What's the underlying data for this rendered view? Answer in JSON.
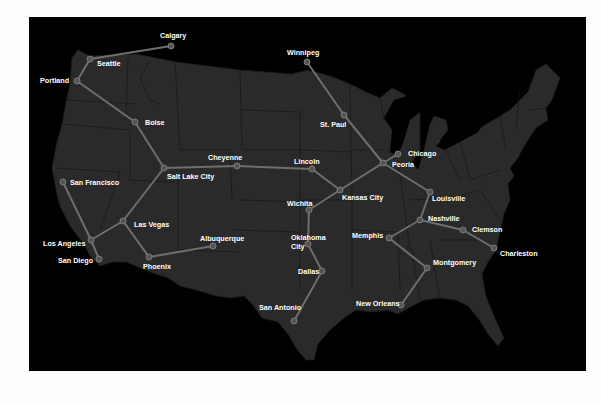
{
  "map": {
    "title": "US rail network",
    "colors": {
      "page_background": "#fdfdfd",
      "ocean": "#000000",
      "land": "#2a2a2a",
      "edge": "#6e6e6e",
      "node": "#555555",
      "label": "#ffffff"
    },
    "nodes": [
      {
        "id": "calgary",
        "label": "Calgary",
        "x": 171,
        "y": 46,
        "lx": 160,
        "ly": 38
      },
      {
        "id": "seattle",
        "label": "Seattle",
        "x": 90,
        "y": 59,
        "lx": 97,
        "ly": 66
      },
      {
        "id": "portland",
        "label": "Portland",
        "x": 77,
        "y": 81,
        "lx": 40,
        "ly": 83
      },
      {
        "id": "boise",
        "label": "Boise",
        "x": 135,
        "y": 122,
        "lx": 145,
        "ly": 125
      },
      {
        "id": "salt-lake-city",
        "label": "Salt Lake City",
        "x": 164,
        "y": 168,
        "lx": 167,
        "ly": 179
      },
      {
        "id": "cheyenne",
        "label": "Cheyenne",
        "x": 237,
        "y": 166,
        "lx": 208,
        "ly": 160
      },
      {
        "id": "lincoln",
        "label": "Lincoln",
        "x": 312,
        "y": 169,
        "lx": 294,
        "ly": 164
      },
      {
        "id": "san-francisco",
        "label": "San Francisco",
        "x": 63,
        "y": 182,
        "lx": 70,
        "ly": 185
      },
      {
        "id": "las-vegas",
        "label": "Las Vegas",
        "x": 123,
        "y": 221,
        "lx": 134,
        "ly": 227
      },
      {
        "id": "los-angeles",
        "label": "Los Angeles",
        "x": 91,
        "y": 240,
        "lx": 43,
        "ly": 246
      },
      {
        "id": "san-diego",
        "label": "San Diego",
        "x": 99,
        "y": 259,
        "lx": 58,
        "ly": 263
      },
      {
        "id": "phoenix",
        "label": "Phoenix",
        "x": 149,
        "y": 257,
        "lx": 143,
        "ly": 269
      },
      {
        "id": "albuquerque",
        "label": "Albuquerque",
        "x": 213,
        "y": 246,
        "lx": 200,
        "ly": 241
      },
      {
        "id": "winnipeg",
        "label": "Winnipeg",
        "x": 307,
        "y": 62,
        "lx": 287,
        "ly": 55
      },
      {
        "id": "st-paul",
        "label": "St. Paul",
        "x": 344,
        "y": 115,
        "lx": 320,
        "ly": 127
      },
      {
        "id": "chicago",
        "label": "Chicago",
        "x": 398,
        "y": 154,
        "lx": 408,
        "ly": 156
      },
      {
        "id": "peoria",
        "label": "Peoria",
        "x": 383,
        "y": 163,
        "lx": 392,
        "ly": 167
      },
      {
        "id": "kansas-city",
        "label": "Kansas City",
        "x": 340,
        "y": 190,
        "lx": 342,
        "ly": 200
      },
      {
        "id": "wichita",
        "label": "Wichita",
        "x": 309,
        "y": 210,
        "lx": 287,
        "ly": 206
      },
      {
        "id": "oklahoma-city",
        "label": "Oklahoma City",
        "x": 308,
        "y": 244,
        "lx": 291,
        "ly": 240,
        "label2": "City",
        "ly2": 249
      },
      {
        "id": "dallas",
        "label": "Dallas",
        "x": 322,
        "y": 271,
        "lx": 298,
        "ly": 274
      },
      {
        "id": "san-antonio",
        "label": "San Antonio",
        "x": 294,
        "y": 321,
        "lx": 259,
        "ly": 310
      },
      {
        "id": "louisville",
        "label": "Louisville",
        "x": 430,
        "y": 192,
        "lx": 432,
        "ly": 201
      },
      {
        "id": "nashville",
        "label": "Nashville",
        "x": 420,
        "y": 220,
        "lx": 428,
        "ly": 221
      },
      {
        "id": "clemson",
        "label": "Clemson",
        "x": 463,
        "y": 230,
        "lx": 472,
        "ly": 232
      },
      {
        "id": "charleston",
        "label": "Charleston",
        "x": 494,
        "y": 248,
        "lx": 500,
        "ly": 256
      },
      {
        "id": "memphis",
        "label": "Memphis",
        "x": 389,
        "y": 238,
        "lx": 352,
        "ly": 238
      },
      {
        "id": "montgomery",
        "label": "Montgomery",
        "x": 427,
        "y": 268,
        "lx": 433,
        "ly": 265
      },
      {
        "id": "new-orleans",
        "label": "New Orleans",
        "x": 401,
        "y": 305,
        "lx": 356,
        "ly": 306
      }
    ],
    "edges": [
      [
        "calgary",
        "seattle"
      ],
      [
        "seattle",
        "portland"
      ],
      [
        "portland",
        "boise"
      ],
      [
        "boise",
        "salt-lake-city"
      ],
      [
        "salt-lake-city",
        "cheyenne"
      ],
      [
        "cheyenne",
        "lincoln"
      ],
      [
        "salt-lake-city",
        "las-vegas"
      ],
      [
        "las-vegas",
        "los-angeles"
      ],
      [
        "las-vegas",
        "phoenix"
      ],
      [
        "phoenix",
        "albuquerque"
      ],
      [
        "san-francisco",
        "los-angeles"
      ],
      [
        "los-angeles",
        "san-diego"
      ],
      [
        "lincoln",
        "kansas-city"
      ],
      [
        "winnipeg",
        "st-paul"
      ],
      [
        "st-paul",
        "peoria"
      ],
      [
        "chicago",
        "peoria"
      ],
      [
        "peoria",
        "kansas-city"
      ],
      [
        "peoria",
        "louisville"
      ],
      [
        "kansas-city",
        "wichita"
      ],
      [
        "wichita",
        "oklahoma-city"
      ],
      [
        "oklahoma-city",
        "dallas"
      ],
      [
        "dallas",
        "san-antonio"
      ],
      [
        "louisville",
        "nashville"
      ],
      [
        "nashville",
        "memphis"
      ],
      [
        "nashville",
        "clemson"
      ],
      [
        "clemson",
        "charleston"
      ],
      [
        "memphis",
        "montgomery"
      ],
      [
        "montgomery",
        "new-orleans"
      ]
    ]
  }
}
